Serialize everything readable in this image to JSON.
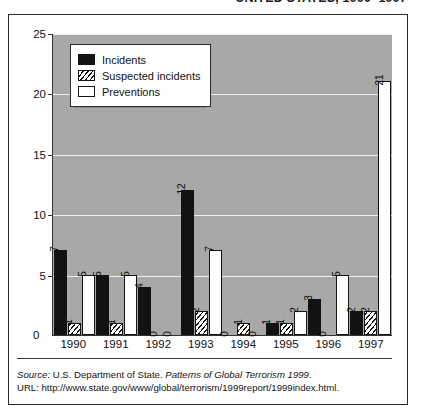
{
  "title_clipped": "UNITED STATES, 1990–1997",
  "legend": {
    "items": [
      {
        "key": "incidents",
        "label": "Incidents"
      },
      {
        "key": "suspected",
        "label": "Suspected incidents"
      },
      {
        "key": "preventions",
        "label": "Preventions"
      }
    ]
  },
  "axis": {
    "zero_label": "0",
    "y_ticks": [
      "5",
      "10",
      "15",
      "20",
      "25"
    ]
  },
  "footnote": {
    "source_prefix": "Source:",
    "source_body": " U.S. Department of State. ",
    "source_italic": "Patterns of Global Terrorism 1999",
    "source_suffix": ".",
    "url_prefix": "URL:",
    "url": "  http://www.state.gov/www/global/terrorism/1999report/1999index.html."
  },
  "chart_data": {
    "type": "bar",
    "title": "UNITED STATES, 1990–1997",
    "xlabel": "",
    "ylabel": "",
    "ylim": [
      0,
      25
    ],
    "yticks": [
      0,
      5,
      10,
      15,
      20,
      25
    ],
    "grid": true,
    "legend_position": "top-left inside plot",
    "categories": [
      "1990",
      "1991",
      "1992",
      "1993",
      "1994",
      "1995",
      "1996",
      "1997"
    ],
    "series": [
      {
        "name": "Incidents",
        "values": [
          7,
          5,
          4,
          12,
          0,
          1,
          3,
          2
        ]
      },
      {
        "name": "Suspected incidents",
        "values": [
          1,
          1,
          0,
          2,
          1,
          1,
          0,
          2
        ]
      },
      {
        "name": "Preventions",
        "values": [
          5,
          5,
          0,
          7,
          0,
          2,
          5,
          21
        ]
      }
    ],
    "data_labels": [
      {
        "category": "1990",
        "incidents": "7",
        "suspected": "1",
        "preventions": "5"
      },
      {
        "category": "1991",
        "incidents": "5",
        "suspected": "1",
        "preventions": "5"
      },
      {
        "category": "1992",
        "incidents": "4",
        "suspected": "0",
        "preventions": "0"
      },
      {
        "category": "1993",
        "incidents": "12",
        "suspected": "2",
        "preventions": "7"
      },
      {
        "category": "1994",
        "incidents": "0",
        "suspected": "1",
        "preventions": "0"
      },
      {
        "category": "1995",
        "incidents": "1",
        "suspected": "1",
        "preventions": "2"
      },
      {
        "category": "1996",
        "incidents": "3",
        "suspected": "0",
        "preventions": "5"
      },
      {
        "category": "1997",
        "incidents": "2",
        "suspected": "2",
        "preventions": "21"
      }
    ]
  }
}
